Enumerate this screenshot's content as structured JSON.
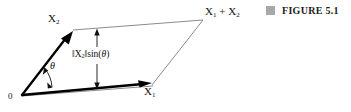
{
  "figure": {
    "caption_label": "FIGURE 5.1",
    "caption_marker_color": "#a8a8a8",
    "background_color": "#ffffff",
    "vector_color": "#000000",
    "construction_line_color": "#8c8c8c",
    "annotation_color": "#1a1a1a"
  },
  "labels": {
    "origin": "0",
    "vector_x1_base": "X",
    "vector_x1_sub": "1",
    "vector_x2_base": "X",
    "vector_x2_sub": "2",
    "sum_first_base": "X",
    "sum_first_sub": "1",
    "sum_operator": "+",
    "sum_second_base": "X",
    "sum_second_sub": "2",
    "angle": "θ",
    "height_norm_open": "‖",
    "height_base": "X",
    "height_sub": "2",
    "height_norm_close": "‖",
    "height_function": "sin(",
    "height_function_arg": "θ",
    "height_function_close": ")"
  },
  "geometry": {
    "origin_point": "22,95",
    "x1_tip": "151,83",
    "x2_tip": "73,32",
    "sum_vertex": "202,20",
    "height_arrow_x": 97,
    "height_arrow_top_y": 29,
    "height_arrow_bottom_y": 89
  }
}
